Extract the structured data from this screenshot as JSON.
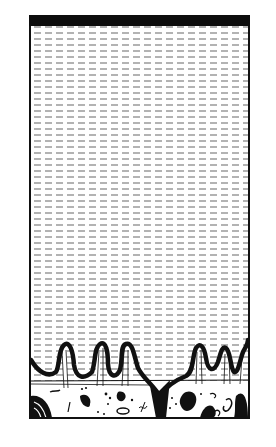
{
  "figure": {
    "title": "",
    "frame": {
      "x": 29,
      "y": 15,
      "width": 221,
      "height": 404
    },
    "top_bar": {
      "height": 11,
      "color": "#0d0d0d"
    },
    "water": {
      "pattern": "dashed-horizontal-lines",
      "line_color": "#8a8a8a",
      "line_spacing_px": 6,
      "dash_px": 7,
      "gap_px": 4
    },
    "features": {
      "left_columns": 3,
      "right_columns": 3,
      "floor_layer": "rubble with irregular dark clasts",
      "ink_color": "#111111"
    }
  }
}
